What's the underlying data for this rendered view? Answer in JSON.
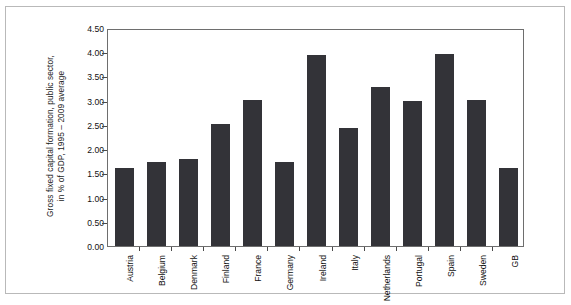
{
  "chart_data": {
    "type": "bar",
    "title": "",
    "subtitle": "",
    "xlabel": "",
    "ylabel": "Gross fixed capital formation, public sector, in % of GDP, 1995 – 2009 average",
    "ylabel_lines": [
      "Gross fixed capital formation, public sector,",
      "in % of GDP, 1995 – 2009 average"
    ],
    "categories": [
      "Austria",
      "Belgium",
      "Denmark",
      "Finland",
      "France",
      "Germany",
      "Ireland",
      "Italy",
      "Netherlands",
      "Portugal",
      "Spain",
      "Sweden",
      "GB"
    ],
    "values": [
      1.63,
      1.76,
      1.82,
      2.54,
      3.04,
      1.74,
      3.97,
      2.45,
      3.31,
      3.03,
      4.0,
      3.05,
      1.62
    ],
    "ylim": [
      0.0,
      4.5
    ],
    "ytick_values": [
      0.0,
      0.5,
      1.0,
      1.5,
      2.0,
      2.5,
      3.0,
      3.5,
      4.0,
      4.5
    ],
    "ytick_labels": [
      "0.00",
      "0.50",
      "1.00",
      "1.50",
      "2.00",
      "2.50",
      "3.00",
      "3.50",
      "4.00",
      "4.50"
    ],
    "grid": false,
    "legend": null,
    "legend_position": "none",
    "bar_color": "#333338",
    "axis_color": "#6e6e6e",
    "background_color": "#ffffff",
    "annotations": []
  }
}
